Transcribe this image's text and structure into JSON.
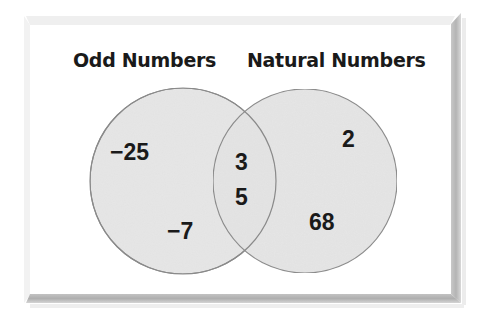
{
  "diagram": {
    "type": "venn",
    "sets": [
      {
        "label": "Odd Numbers",
        "only_elements": [
          "−25",
          "−7"
        ]
      },
      {
        "label": "Natural Numbers",
        "only_elements": [
          "2",
          "68"
        ]
      }
    ],
    "intersection": [
      "3",
      "5"
    ]
  },
  "titles": {
    "left": "Odd Numbers",
    "right": "Natural Numbers"
  },
  "elements": {
    "left_only": [
      "−25",
      "−7"
    ],
    "intersection": [
      "3",
      "5"
    ],
    "right_only": [
      "2",
      "68"
    ]
  },
  "colors": {
    "background": "#ffffff",
    "circle_fill": "#e6e6e6",
    "circle_stroke": "#8a8a8a",
    "bevel_dark": "#b5b5b5",
    "bevel_light": "#f0f0f0",
    "text": "#1a1a1a"
  }
}
